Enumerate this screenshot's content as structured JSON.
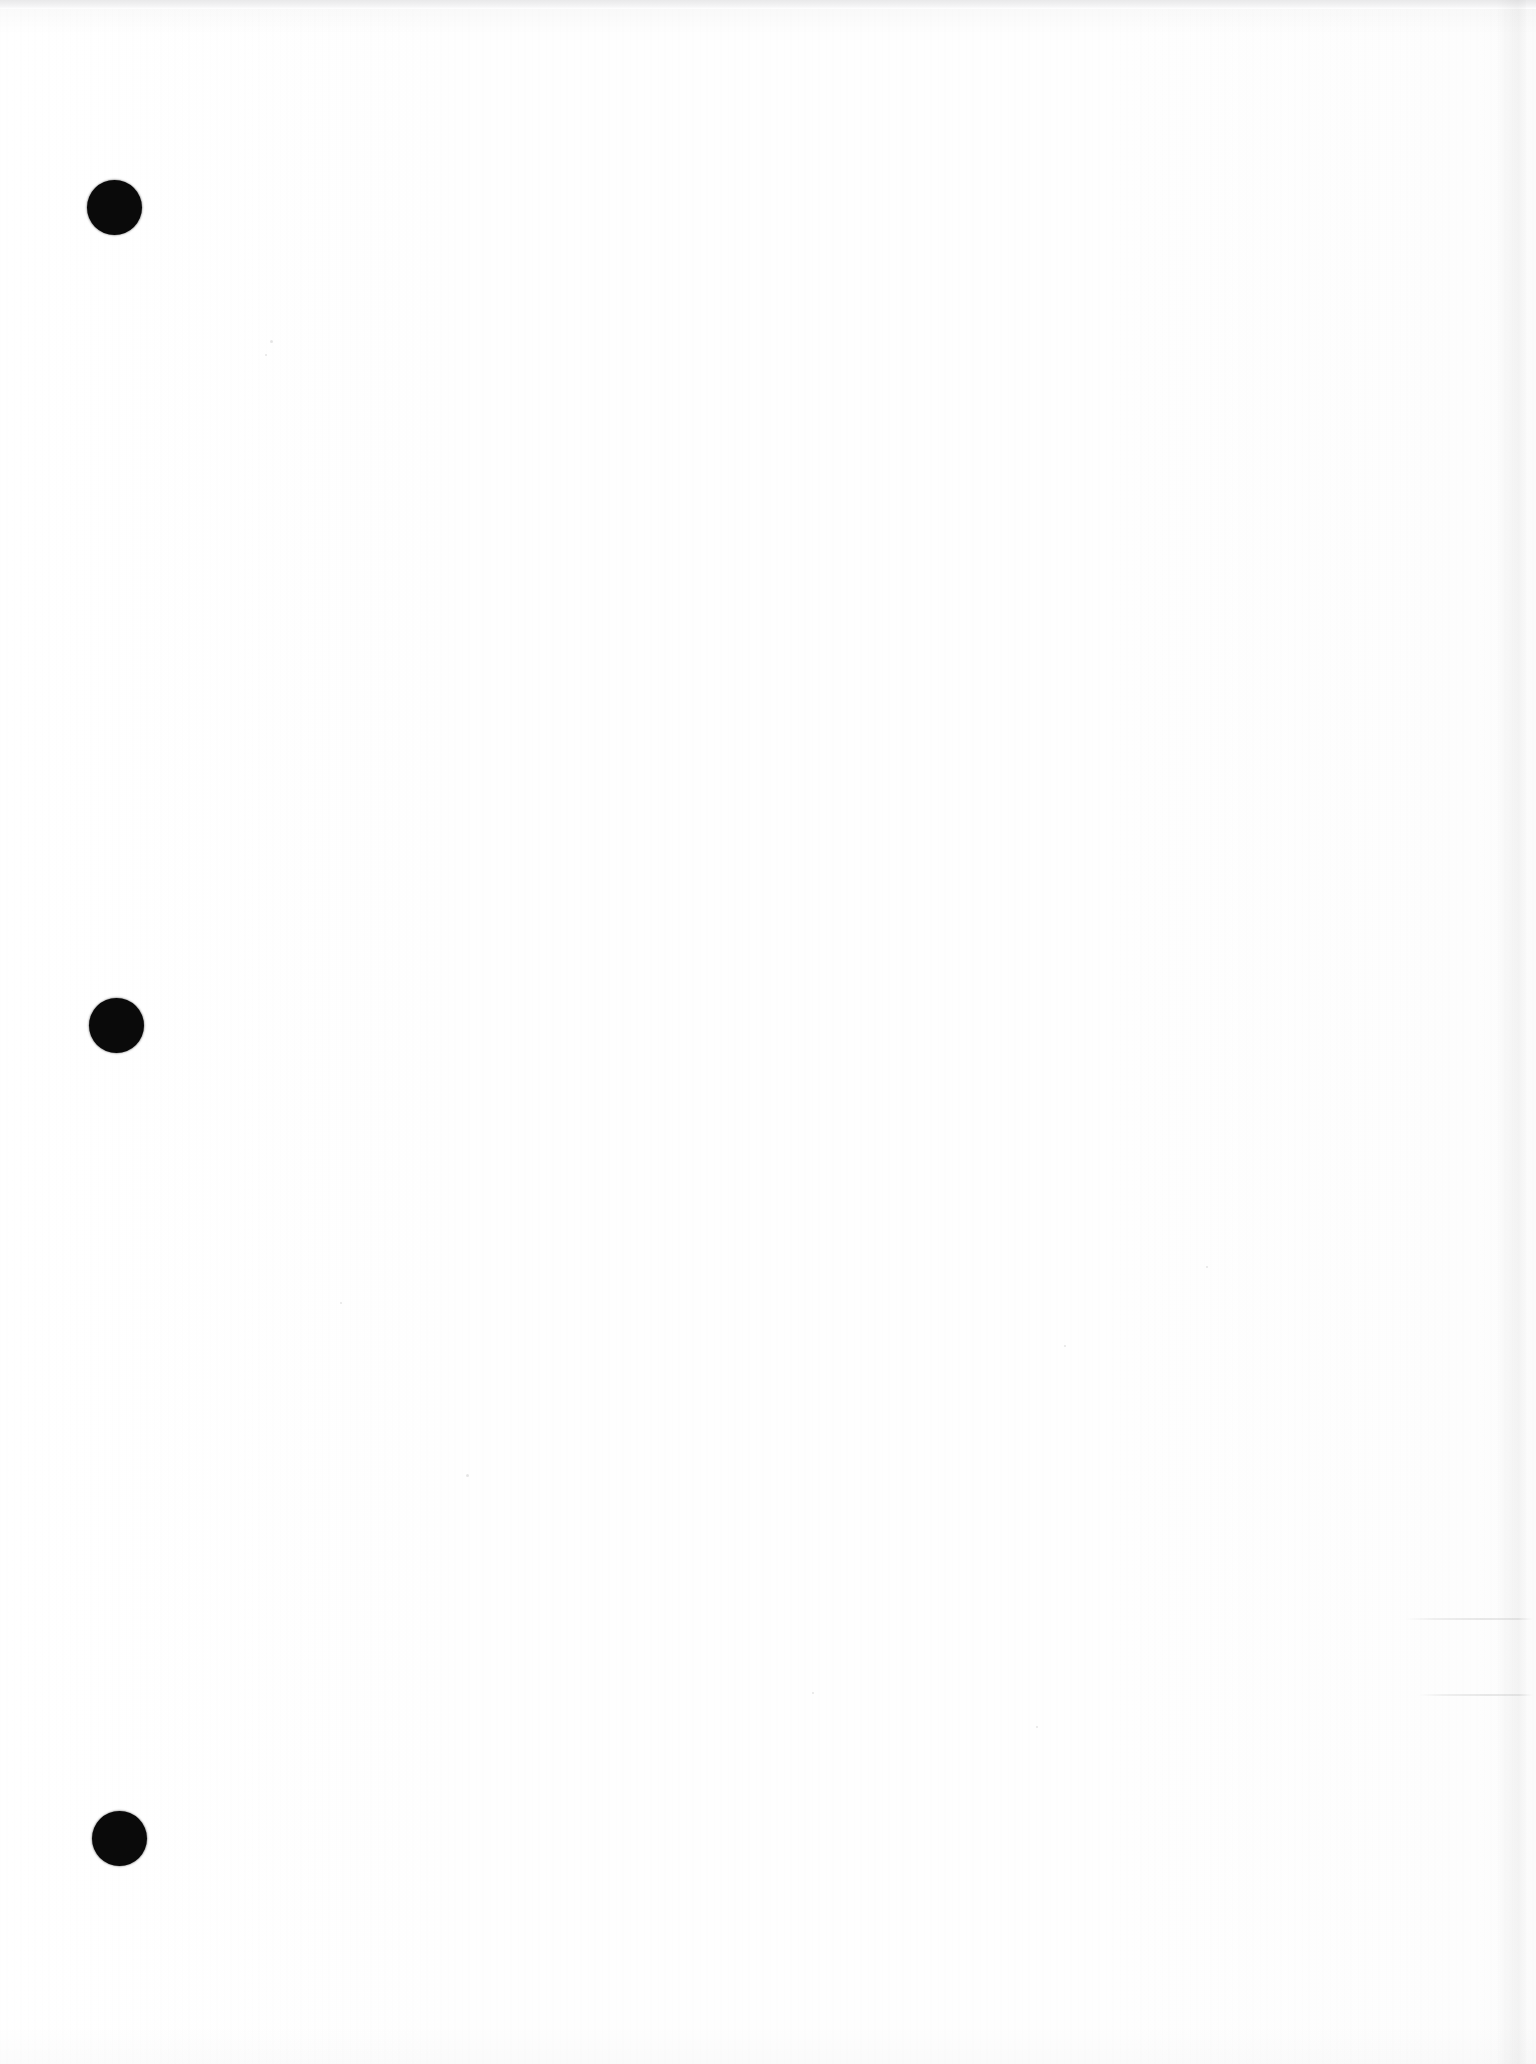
{
  "document": {
    "title": "Scanned blank page",
    "page_label": "",
    "body_text": "",
    "background_color": "#ffffff",
    "ink_color": "#0a0a0a",
    "width_px": 1536,
    "height_px": 2064
  },
  "artifacts": {
    "top_scan_band": {
      "name": "top-scan-band",
      "color": "#e9e9ea",
      "x": 0,
      "y": 0,
      "width": 1536,
      "height": 9
    },
    "right_page_edge": {
      "name": "right-page-edge",
      "color": "#f2f2f2",
      "x": 1496,
      "y": 0,
      "width": 30,
      "height": 2064
    },
    "hole_punches": [
      {
        "label": "top hole punch",
        "x": 114,
        "y": 207,
        "diameter": 55,
        "color": "#0a0a0a"
      },
      {
        "label": "middle hole punch",
        "x": 116,
        "y": 1025,
        "diameter": 55,
        "color": "#0a0a0a"
      },
      {
        "label": "bottom hole punch",
        "x": 119,
        "y": 1838,
        "diameter": 55,
        "color": "#0a0a0a"
      }
    ],
    "scan_lines": [
      {
        "label": "upper scan streak",
        "x": 1405,
        "y": 1618,
        "width": 128,
        "color": "#e4e4e4"
      },
      {
        "label": "lower scan streak",
        "x": 1418,
        "y": 1694,
        "width": 115,
        "color": "#e6e6e6"
      }
    ],
    "specks": [
      {
        "x": 270,
        "y": 340,
        "size": 3
      },
      {
        "x": 265,
        "y": 354,
        "size": 2
      },
      {
        "x": 466,
        "y": 1474,
        "size": 3
      },
      {
        "x": 1064,
        "y": 1345,
        "size": 2
      },
      {
        "x": 1206,
        "y": 1266,
        "size": 2
      },
      {
        "x": 812,
        "y": 1692,
        "size": 2
      },
      {
        "x": 1036,
        "y": 1726,
        "size": 2
      },
      {
        "x": 340,
        "y": 1302,
        "size": 2
      }
    ]
  }
}
